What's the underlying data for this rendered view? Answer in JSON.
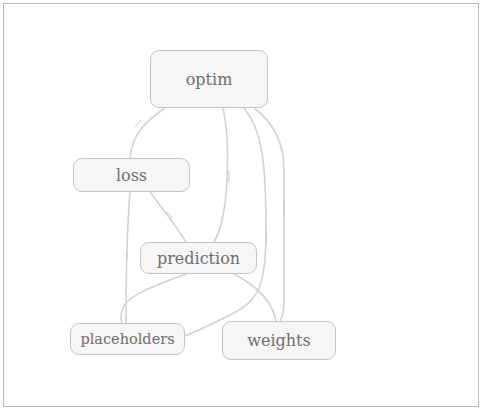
{
  "diagram": {
    "type": "dependency-graph",
    "colors": {
      "node_fill": "#f6f6f6",
      "node_border": "#c4c4c4",
      "edge": "#d2d2d2",
      "text": "#6e6e6e",
      "frame": "#b8b8b8"
    },
    "nodes": [
      {
        "id": "optim",
        "label": "optim"
      },
      {
        "id": "loss",
        "label": "loss"
      },
      {
        "id": "prediction",
        "label": "prediction"
      },
      {
        "id": "placeholders",
        "label": "placeholders"
      },
      {
        "id": "weights",
        "label": "weights"
      }
    ],
    "edges": [
      {
        "from": "optim",
        "to": "loss"
      },
      {
        "from": "optim",
        "to": "prediction"
      },
      {
        "from": "optim",
        "to": "placeholders"
      },
      {
        "from": "optim",
        "to": "weights"
      },
      {
        "from": "loss",
        "to": "prediction"
      },
      {
        "from": "loss",
        "to": "placeholders"
      },
      {
        "from": "prediction",
        "to": "placeholders"
      },
      {
        "from": "prediction",
        "to": "weights"
      }
    ]
  }
}
